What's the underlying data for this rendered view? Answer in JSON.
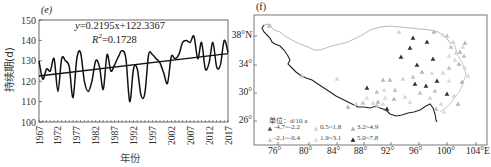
{
  "chart_data": [
    {
      "panel_label": "(e)",
      "type": "line",
      "title": "",
      "xlabel": "年份",
      "ylabel": "持续期(d)",
      "ylim": [
        100,
        150
      ],
      "xlim": [
        1967,
        2017
      ],
      "yticks": [
        100,
        110,
        120,
        130,
        140,
        150
      ],
      "xticks": [
        1967,
        1972,
        1977,
        1982,
        1987,
        1992,
        1997,
        2002,
        2007,
        2012,
        2017
      ],
      "grid": false,
      "x": [
        1967,
        1968,
        1969,
        1970,
        1971,
        1972,
        1973,
        1974,
        1975,
        1976,
        1977,
        1978,
        1979,
        1980,
        1981,
        1982,
        1983,
        1984,
        1985,
        1986,
        1987,
        1988,
        1989,
        1990,
        1991,
        1992,
        1993,
        1994,
        1995,
        1996,
        1997,
        1998,
        1999,
        2000,
        2001,
        2002,
        2003,
        2004,
        2005,
        2006,
        2007,
        2008,
        2009,
        2010,
        2011,
        2012,
        2013,
        2014,
        2015,
        2016,
        2017
      ],
      "series": [
        {
          "name": "持续期",
          "values": [
            130,
            121,
            126,
            125,
            131,
            115,
            131,
            130,
            127,
            112,
            131,
            134,
            120,
            115,
            120,
            130,
            127,
            116,
            133,
            125,
            128,
            132,
            135,
            131,
            110,
            126,
            126,
            113,
            114,
            133,
            133,
            131,
            129,
            124,
            119,
            132,
            131,
            133,
            139,
            140,
            139,
            142,
            131,
            139,
            126,
            129,
            139,
            127,
            128,
            140,
            134
          ]
        },
        {
          "name": "trend",
          "equation": "y=0.2195x+122.3367",
          "slope": 0.2195,
          "intercept": 122.3367
        }
      ],
      "annotations": [
        "y=0.2195x+122.3367",
        "R²=0.1728"
      ]
    },
    {
      "panel_label": "(f)",
      "type": "scatter",
      "title": "",
      "xlabel": "",
      "ylabel": "",
      "xticks": [
        "76°",
        "80°",
        "84°",
        "88°",
        "92°",
        "96°",
        "100°",
        "104°E"
      ],
      "yticks": [
        "26°",
        "30°",
        "34°",
        "38°N"
      ],
      "legend": {
        "unit": "单位：d/10 a",
        "entries": [
          {
            "label": "-4.7~-2.2",
            "marker": "triangle",
            "color": "#555555"
          },
          {
            "label": "0.5~1.8",
            "marker": "triangle",
            "color": "#d0d0d0"
          },
          {
            "label": "3.2~4.9",
            "marker": "triangle",
            "color": "#b0b0b0"
          },
          {
            "label": "-2.1~-0.4",
            "marker": "triangle",
            "color": "#c8c8c8"
          },
          {
            "label": "1.9~3.1",
            "marker": "triangle",
            "color": "#dcdcdc"
          },
          {
            "label": "5.0~7.8",
            "marker": "triangle",
            "color": "#222222"
          }
        ],
        "position": "lower-left"
      }
    }
  ],
  "left": {
    "panel_label": "(e)",
    "equation": "y=0.2195x+122.3367",
    "r2_prefix": "R",
    "r2_sup": "2",
    "r2_value": "=0.1728",
    "ylabel": "持续期(d)",
    "xlabel": "年份"
  },
  "right": {
    "panel_label": "(f)",
    "legend_unit": "单位：d/10 a",
    "legend": [
      "-4.7~-2.2",
      "0.5~1.8",
      "3.2~4.9",
      "-2.1~-0.4",
      "1.9~3.1",
      "5.0~7.8"
    ],
    "yticks": [
      "38°N",
      "34°",
      "30°",
      "26°"
    ],
    "xticks": [
      "76°",
      "80°",
      "84°",
      "88°",
      "92°",
      "96°",
      "100°",
      "104°E"
    ]
  }
}
